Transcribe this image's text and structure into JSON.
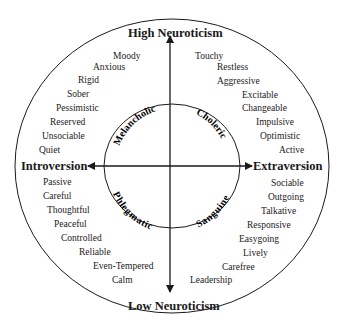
{
  "axes": {
    "top": "High Neuroticism",
    "bottom": "Low Neuroticism",
    "left": "Introversion",
    "right": "Extraversion"
  },
  "temperaments": {
    "upper_left": "Melancholic",
    "upper_right": "Choleric",
    "lower_left": "Phlegmatic",
    "lower_right": "Sanguine"
  },
  "traits": {
    "upper_left": [
      "Moody",
      "Anxious",
      "Rigid",
      "Sober",
      "Pessimistic",
      "Reserved",
      "Unsociable",
      "Quiet"
    ],
    "upper_right": [
      "Touchy",
      "Restless",
      "Aggressive",
      "Excitable",
      "Changeable",
      "Impulsive",
      "Optimistic",
      "Active"
    ],
    "lower_left": [
      "Passive",
      "Careful",
      "Thoughtful",
      "Peaceful",
      "Controlled",
      "Reliable",
      "Even-Tempered",
      "Calm"
    ],
    "lower_right": [
      "Sociable",
      "Outgoing",
      "Talkative",
      "Responsive",
      "Easygoing",
      "Lively",
      "Carefree",
      "Leadership"
    ]
  },
  "colors": {
    "line": "#1a1a1a",
    "background": "#ffffff"
  }
}
